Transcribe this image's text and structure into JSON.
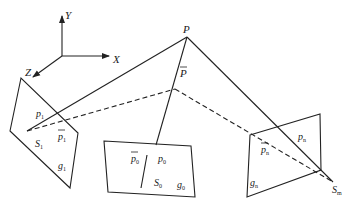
{
  "diagram": {
    "type": "multi-view projection geometry",
    "axes": {
      "x_label": "X",
      "y_label": "Y",
      "z_label": "Z"
    },
    "point": {
      "label": "P",
      "estimate_label": "P",
      "estimate_bar": true
    },
    "views": [
      {
        "id": "view-1",
        "image_point": "p",
        "image_point_sub": "1",
        "reprojected_point": "p",
        "reprojected_sub": "1",
        "center": "S",
        "center_sub": "1",
        "image_label": "g",
        "image_sub": "1"
      },
      {
        "id": "view-0",
        "image_point": "p",
        "image_point_sub": "0",
        "reprojected_point": "p",
        "reprojected_sub": "0",
        "center": "S",
        "center_sub": "0",
        "image_label": "g",
        "image_sub": "0"
      },
      {
        "id": "view-n",
        "image_point": "p",
        "image_point_sub": "n",
        "reprojected_point": "p",
        "reprojected_sub": "n",
        "center": "S",
        "center_sub": "m",
        "image_label": "g",
        "image_sub": "n"
      }
    ],
    "legend": {
      "solid": "rays to P",
      "dashed": "rays to P-bar"
    }
  }
}
